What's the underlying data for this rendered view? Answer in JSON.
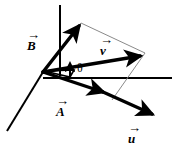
{
  "figure": {
    "type": "vector-diagram",
    "background_color": "#ffffff",
    "stroke_color": "#000000",
    "thin_line_color": "#8a8a8a",
    "width": 173,
    "height": 148,
    "origin": {
      "x": 43,
      "y": 72
    }
  },
  "axes": [
    {
      "name": "vertical-axis",
      "from": {
        "x": 60,
        "y": 5
      },
      "to": {
        "x": 60,
        "y": 76
      },
      "stroke_width": 2.0
    },
    {
      "name": "horizontal-axis",
      "from": {
        "x": 43,
        "y": 78
      },
      "to": {
        "x": 172,
        "y": 78
      },
      "stroke_width": 2.0
    },
    {
      "name": "depth-axis",
      "from": {
        "x": 43,
        "y": 72
      },
      "to": {
        "x": 7,
        "y": 131
      },
      "stroke_width": 2.0
    }
  ],
  "vectors": [
    {
      "name": "vector-B",
      "label": "B",
      "arrow_accent": "→",
      "from": {
        "x": 43,
        "y": 72
      },
      "to": {
        "x": 81,
        "y": 23
      },
      "stroke_width": 3.4,
      "label_position": {
        "x": 27,
        "y": 33
      },
      "label_font_size": 13
    },
    {
      "name": "vector-A",
      "label": "A",
      "arrow_accent": "→",
      "from": {
        "x": 43,
        "y": 72
      },
      "to": {
        "x": 110,
        "y": 95
      },
      "stroke_width": 3.4,
      "label_position": {
        "x": 55,
        "y": 99
      },
      "label_font_size": 13
    },
    {
      "name": "vector-v",
      "label": "v",
      "arrow_accent": "→",
      "from": {
        "x": 43,
        "y": 72
      },
      "to": {
        "x": 144,
        "y": 54
      },
      "stroke_width": 3.4,
      "label_position": {
        "x": 99,
        "y": 38
      },
      "label_font_size": 13
    },
    {
      "name": "vector-u",
      "label": "u",
      "arrow_accent": "→",
      "from": {
        "x": 43,
        "y": 72
      },
      "to": {
        "x": 158,
        "y": 118
      },
      "stroke_width": 3.4,
      "label_position": {
        "x": 127,
        "y": 126
      },
      "label_font_size": 13
    }
  ],
  "construction_lines": [
    {
      "name": "parallelogram-line-top",
      "from": {
        "x": 81,
        "y": 23
      },
      "to": {
        "x": 145,
        "y": 53
      },
      "stroke_width": 1.0
    },
    {
      "name": "parallelogram-line-bottom",
      "from": {
        "x": 145,
        "y": 53
      },
      "to": {
        "x": 112,
        "y": 100
      },
      "stroke_width": 1.0
    }
  ],
  "annotations": [
    {
      "name": "angle-theta",
      "label": "θ",
      "label_position": {
        "x": 77,
        "y": 63
      },
      "label_font_size": 12
    },
    {
      "name": "theta-indicator-arrow",
      "from": {
        "x": 70,
        "y": 78
      },
      "to": {
        "x": 70,
        "y": 62
      },
      "stroke_width": 2.0
    },
    {
      "name": "angle-wedge-marker",
      "description": "small wedge between vector-A and vector-v at origin"
    }
  ]
}
